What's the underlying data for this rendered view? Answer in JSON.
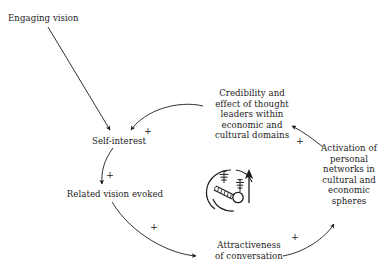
{
  "diagram": {
    "background_color": "#ffffff",
    "ink_color": "#1c1c1c",
    "nodes": [
      {
        "id": "engaging-vision",
        "label": "Engaging vision"
      },
      {
        "id": "self-interest",
        "label": "Self-interest"
      },
      {
        "id": "related-vision",
        "label": "Related vision evoked"
      },
      {
        "id": "credibility",
        "label": "Credibility and\neffect of thought\nleaders within\neconomic and\ncultural domains"
      },
      {
        "id": "activation",
        "label": "Activation of\npersonal\nnetworks in\ncultural and\neconomic\nspheres"
      },
      {
        "id": "attractiveness",
        "label": "Attractiveness\nof conversation"
      }
    ],
    "links": [
      {
        "id": "engaging-to-self",
        "from": "engaging-vision",
        "to": "self-interest",
        "polarity": "",
        "style": "straight"
      },
      {
        "id": "credibility-to-self",
        "from": "credibility",
        "to": "self-interest",
        "polarity": "+",
        "style": "curved"
      },
      {
        "id": "self-to-related",
        "from": "self-interest",
        "to": "related-vision",
        "polarity": "+",
        "style": "curved"
      },
      {
        "id": "related-to-attractiveness",
        "from": "related-vision",
        "to": "attractiveness",
        "polarity": "+",
        "style": "curved"
      },
      {
        "id": "attractiveness-to-activation",
        "from": "attractiveness",
        "to": "activation",
        "polarity": "+",
        "style": "curved"
      },
      {
        "id": "activation-to-credibility",
        "from": "activation",
        "to": "credibility",
        "polarity": "+",
        "style": "curved"
      }
    ],
    "polarity_marks": [
      {
        "id": "plus-credibility-to-self",
        "symbol": "+"
      },
      {
        "id": "plus-self-to-related",
        "symbol": "+"
      },
      {
        "id": "plus-related-to-attractiveness",
        "symbol": "+"
      },
      {
        "id": "plus-attractiveness-to-activation",
        "symbol": "+"
      },
      {
        "id": "plus-activation-to-credibility",
        "symbol": "+"
      }
    ],
    "center_icon": {
      "name": "reinforcing-loop-landscape-icon",
      "description": "circular rotating-arrow loop enclosing a small landscape of pine trees"
    }
  }
}
